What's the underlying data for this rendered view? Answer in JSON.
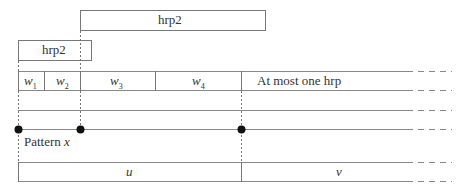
{
  "diagram": {
    "top_box_label": "hrp2",
    "left_box_label": "hrp2",
    "segments": [
      {
        "name": "w",
        "sub": "1"
      },
      {
        "name": "w",
        "sub": "2"
      },
      {
        "name": "w",
        "sub": "3"
      },
      {
        "name": "w",
        "sub": "4"
      }
    ],
    "row_note": "At most one hrp",
    "pattern_label": "Pattern",
    "pattern_var": "x",
    "bottom_left_label": "u",
    "bottom_right_label": "v"
  }
}
